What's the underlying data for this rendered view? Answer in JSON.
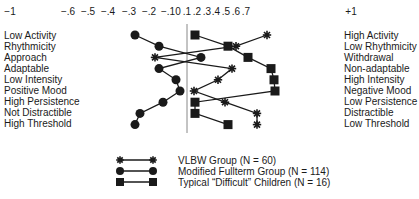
{
  "chart_data": {
    "type": "line",
    "orientation": "horizontal-profile",
    "title": "",
    "x_axis": {
      "ticks": [
        "-1",
        "-.6",
        "-.5",
        "-.4",
        "-.3",
        "-.2",
        "-.1",
        "0",
        ".1",
        ".2",
        ".3",
        ".4",
        ".5",
        ".6",
        ".7",
        "+1"
      ],
      "range": [
        -1,
        1
      ]
    },
    "categories_left": [
      "Low Activity",
      "Rhythmicity",
      "Approach",
      "Adaptable",
      "Low Intensity",
      "Positive Mood",
      "High Persistence",
      "Not Distractible",
      "High Threshold"
    ],
    "categories_right": [
      "High Activity",
      "Low Rhythmicity",
      "Withdrawal",
      "Non-adaptable",
      "High Intensity",
      "Negative Mood",
      "Low Persistence",
      "Distractible",
      "Low Threshold"
    ],
    "series": [
      {
        "name": "VLBW Group (N = 60)",
        "marker": "star",
        "values": [
          0.8,
          0.49,
          -0.32,
          0.45,
          0.31,
          0.07,
          0.38,
          0.7,
          0.7
        ]
      },
      {
        "name": "Modified Fullterm Group (N = 114)",
        "marker": "circle",
        "values": [
          -0.52,
          -0.28,
          0.14,
          -0.28,
          -0.11,
          -0.07,
          -0.24,
          -0.47,
          -0.52
        ]
      },
      {
        "name": "Typical \"Difficult\" Children (N = 16)",
        "marker": "square",
        "values": [
          0.08,
          0.41,
          0.61,
          0.84,
          0.87,
          0.88,
          0.08,
          0.08,
          0.41
        ]
      }
    ],
    "grid": false,
    "legend_position": "bottom-center"
  },
  "axis": {
    "ticks": [
      {
        "label": "−1",
        "x": 10
      },
      {
        "label": "−.6",
        "x": 68
      },
      {
        "label": "−.5",
        "x": 88
      },
      {
        "label": "−.4",
        "x": 108
      },
      {
        "label": "−.3",
        "x": 129
      },
      {
        "label": "−.2",
        "x": 149
      },
      {
        "label": "−.1",
        "x": 168
      },
      {
        "label": "0",
        "x": 178
      },
      {
        "label": ".1",
        "x": 187
      },
      {
        "label": ".2",
        "x": 197
      },
      {
        "label": ".3",
        "x": 207
      },
      {
        "label": ".4",
        "x": 216
      },
      {
        "label": ".5",
        "x": 226
      },
      {
        "label": ".6",
        "x": 236
      },
      {
        "label": ".7",
        "x": 246
      },
      {
        "label": "+1",
        "x": 351
      }
    ]
  },
  "legend": {
    "items": [
      {
        "label": "VLBW Group (N = 60)"
      },
      {
        "label": "Modified Fullterm Group (N = 114)"
      },
      {
        "label": "Typical “Difficult” Children (N = 16)"
      }
    ]
  }
}
